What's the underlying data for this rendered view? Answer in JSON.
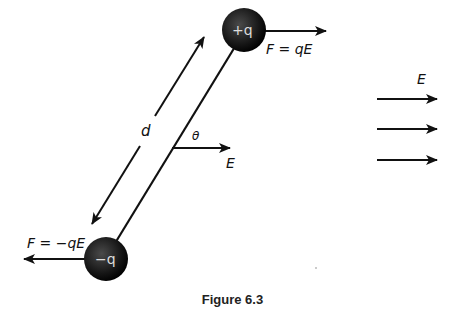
{
  "figure": {
    "caption": "Figure 6.3",
    "labels": {
      "positive_charge": "+q",
      "negative_charge": "−q",
      "force_positive": "F = qE",
      "force_negative": "F = −qE",
      "separation": "d",
      "angle": "θ",
      "field_local": "E",
      "field_legend": "E"
    },
    "colors": {
      "line": "#111111",
      "sphere_core": "#3a3a3a",
      "sphere_edge": "#050505",
      "text": "#111111"
    }
  }
}
